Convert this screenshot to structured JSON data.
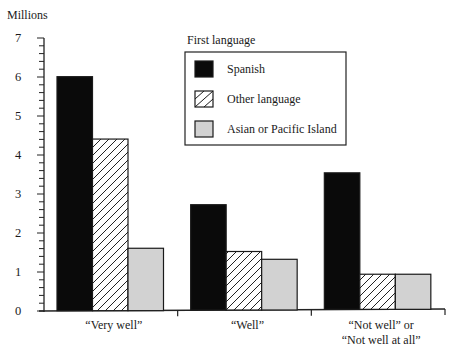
{
  "chart_data": {
    "type": "bar",
    "title": "",
    "xlabel": "",
    "ylabel": "Millions",
    "ylim": [
      0,
      7
    ],
    "yticks": [
      0,
      1,
      2,
      3,
      4,
      5,
      6,
      7
    ],
    "yticks_minor_step": 0.2,
    "grid": false,
    "categories": [
      [
        "“Very well”"
      ],
      [
        "“Well”"
      ],
      [
        "“Not well” or",
        "“Not well at all”"
      ]
    ],
    "legend": {
      "title": "First language",
      "placement": "top-center"
    },
    "series": [
      {
        "name": "Spanish",
        "pattern": "solid-black",
        "color": "#0a0a0a",
        "values": [
          6.0,
          2.7,
          3.5
        ]
      },
      {
        "name": "Other language",
        "pattern": "diagonal-hatch",
        "color": "#ffffff",
        "values": [
          4.4,
          1.5,
          0.9
        ]
      },
      {
        "name": "Asian or Pacific Island",
        "pattern": "solid-gray",
        "color": "#d2d2d2",
        "values": [
          1.6,
          1.3,
          0.9
        ]
      }
    ]
  }
}
